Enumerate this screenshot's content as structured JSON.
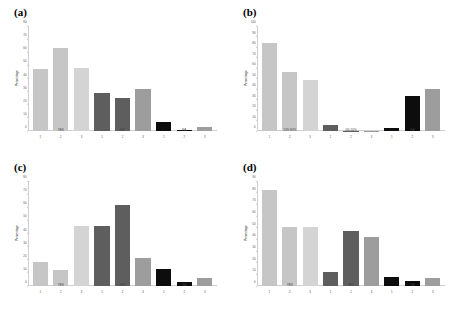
{
  "figure": {
    "panel_count": 4,
    "background": "#ffffff",
    "colors": {
      "light_gray": "#c6c6c6",
      "mid_gray": "#9d9d9d",
      "pale_gray": "#d4d4d4",
      "dark_gray": "#5e5e5e",
      "black": "#0d0d0d",
      "axis": "#cfcfcf",
      "text": "#3a3a3a"
    }
  },
  "chart_data": [
    {
      "type": "bar",
      "title": "(a)",
      "xlabel": "",
      "ylabel": "Percentage",
      "ylim": [
        0,
        80
      ],
      "yticks": [
        0,
        10,
        20,
        30,
        40,
        50,
        60,
        70,
        80
      ],
      "grid": false,
      "legend": "none",
      "categories": [
        "1",
        "2",
        "3",
        "1",
        "2",
        "3",
        "1",
        "2",
        "3"
      ],
      "group_labels": [
        "YES",
        "NO",
        "NA"
      ],
      "values": [
        47,
        63,
        48,
        29,
        25,
        32,
        7,
        1,
        3
      ],
      "bar_colors": [
        "#c6c6c6",
        "#c6c6c6",
        "#d4d4d4",
        "#5e5e5e",
        "#5e5e5e",
        "#9d9d9d",
        "#0d0d0d",
        "#0d0d0d",
        "#9d9d9d"
      ]
    },
    {
      "type": "bar",
      "title": "(b)",
      "xlabel": "",
      "ylabel": "Percentage",
      "ylim": [
        0,
        100
      ],
      "yticks": [
        0,
        10,
        20,
        30,
        40,
        50,
        60,
        70,
        80,
        90,
        100
      ],
      "grid": false,
      "legend": "none",
      "categories": [
        "1",
        "2",
        "3",
        "1",
        "2",
        "3",
        "1",
        "2",
        "3"
      ],
      "group_labels": [
        "10% 90%",
        "0% 50%",
        "NA"
      ],
      "values": [
        84,
        56,
        49,
        6,
        0,
        0,
        3,
        33,
        40
      ],
      "bar_colors": [
        "#c6c6c6",
        "#c6c6c6",
        "#d4d4d4",
        "#5e5e5e",
        "#5e5e5e",
        "#9d9d9d",
        "#0d0d0d",
        "#0d0d0d",
        "#9d9d9d"
      ]
    },
    {
      "type": "bar",
      "title": "(c)",
      "xlabel": "",
      "ylabel": "Percentage",
      "ylim": [
        0,
        80
      ],
      "yticks": [
        0,
        10,
        20,
        30,
        40,
        50,
        60,
        70,
        80
      ],
      "grid": false,
      "legend": "none",
      "categories": [
        "1",
        "2",
        "3",
        "1",
        "2",
        "3",
        "1",
        "2",
        "3"
      ],
      "group_labels": [
        "YES",
        "NO",
        "NA"
      ],
      "values": [
        18,
        12,
        46,
        46,
        62,
        21,
        13,
        3,
        6
      ],
      "bar_colors": [
        "#c6c6c6",
        "#c6c6c6",
        "#d4d4d4",
        "#5e5e5e",
        "#5e5e5e",
        "#9d9d9d",
        "#0d0d0d",
        "#0d0d0d",
        "#9d9d9d"
      ]
    },
    {
      "type": "bar",
      "title": "(d)",
      "xlabel": "",
      "ylabel": "Percentage",
      "ylim": [
        0,
        90
      ],
      "yticks": [
        0,
        10,
        20,
        30,
        40,
        50,
        60,
        70,
        80,
        90
      ],
      "grid": false,
      "legend": "none",
      "categories": [
        "1",
        "2",
        "3",
        "1",
        "2",
        "3",
        "1",
        "2",
        "3"
      ],
      "group_labels": [
        "YES",
        "NO",
        "NA"
      ],
      "values": [
        82,
        51,
        51,
        12,
        47,
        42,
        8,
        4,
        7
      ],
      "bar_colors": [
        "#c6c6c6",
        "#c6c6c6",
        "#d4d4d4",
        "#5e5e5e",
        "#5e5e5e",
        "#9d9d9d",
        "#0d0d0d",
        "#0d0d0d",
        "#9d9d9d"
      ]
    }
  ]
}
